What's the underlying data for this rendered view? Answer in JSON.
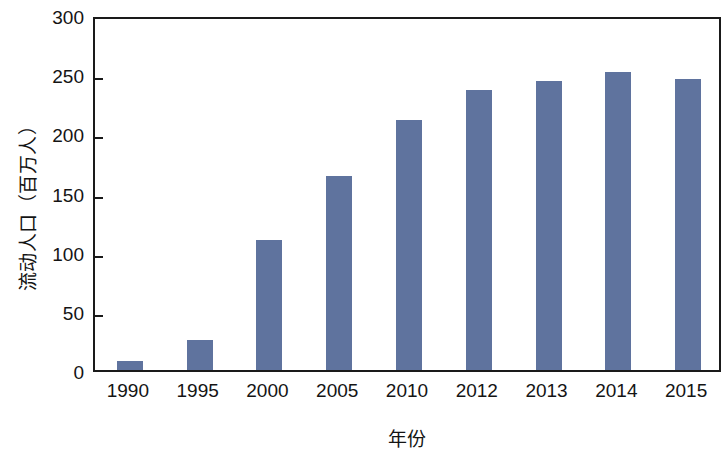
{
  "chart_data": {
    "type": "bar",
    "title": "",
    "xlabel": "年份",
    "ylabel": "流动人口（百万人）",
    "categories": [
      "1990",
      "1995",
      "2000",
      "2005",
      "2010",
      "2012",
      "2013",
      "2014",
      "2015"
    ],
    "values": [
      8,
      25,
      110,
      164,
      211,
      237,
      244,
      252,
      246
    ],
    "series": [
      {
        "name": "流动人口",
        "values": [
          8,
          25,
          110,
          164,
          211,
          237,
          244,
          252,
          246
        ]
      }
    ],
    "ylim": [
      0,
      300
    ],
    "y_ticks": [
      0,
      50,
      100,
      150,
      200,
      250,
      300
    ],
    "y_tick_labels": [
      "0",
      "50",
      "100",
      "150",
      "200",
      "250",
      "300"
    ],
    "grid": false,
    "legend": "none",
    "bar_color": "#5f739e",
    "axis_color": "#1a1a1a",
    "background_color": "#ffffff"
  }
}
